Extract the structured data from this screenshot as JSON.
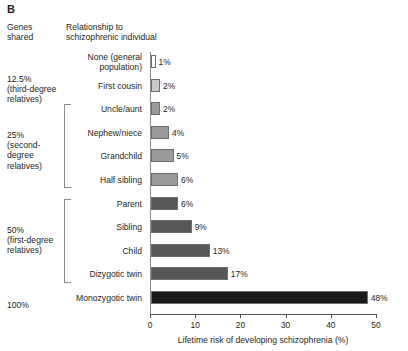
{
  "panel": {
    "letter": "B"
  },
  "headers": {
    "genes_shared": "Genes\nshared",
    "genes_shared_line1": "Genes",
    "genes_shared_line2": "shared",
    "relationship_line1": "Relationship to",
    "relationship_line2": "schizophrenic individual"
  },
  "groups": [
    {
      "id": "third-degree",
      "line1": "12.5%",
      "line2": "(third-degree",
      "line3": "relatives)",
      "bracket": false
    },
    {
      "id": "second-degree",
      "line1": "25%",
      "line2": "(second-degree",
      "line3": "relatives)",
      "bracket": true
    },
    {
      "id": "first-degree",
      "line1": "50%",
      "line2": "(first-degree",
      "line3": "relatives)",
      "bracket": true
    },
    {
      "id": "identical",
      "line1": "100%",
      "line2": "",
      "line3": "",
      "bracket": false
    }
  ],
  "chart_data": {
    "type": "bar",
    "orientation": "horizontal",
    "title": "",
    "xlabel": "Lifetime risk of developing schizophrenia (%)",
    "ylabel": "Relationship to schizophrenic individual",
    "xlim": [
      0,
      50
    ],
    "xticks": [
      0,
      10,
      20,
      30,
      40,
      50
    ],
    "xtick_labels": [
      "0",
      "10",
      "20",
      "30",
      "40",
      "50"
    ],
    "grid": false,
    "legend": "none",
    "categories": [
      "None (general population)",
      "First cousin",
      "Uncle/aunt",
      "Nephew/niece",
      "Grandchild",
      "Half sibling",
      "Parent",
      "Sibling",
      "Child",
      "Dizygotic twin",
      "Monozygotic twin"
    ],
    "values": [
      1,
      2,
      2,
      4,
      5,
      6,
      6,
      9,
      13,
      17,
      48
    ],
    "value_labels": [
      "1%",
      "2%",
      "2%",
      "4%",
      "5%",
      "6%",
      "6%",
      "9%",
      "13%",
      "17%",
      "48%"
    ],
    "bar_colors": [
      "#ffffff",
      "#c9c9c9",
      "#9a9a9a",
      "#9a9a9a",
      "#9a9a9a",
      "#9a9a9a",
      "#575757",
      "#575757",
      "#575757",
      "#575757",
      "#1a1a1a"
    ],
    "rows": [
      {
        "label_line1": "None (general",
        "label_line2": "population)",
        "value": 1,
        "value_label": "1%",
        "color": "#ffffff"
      },
      {
        "label_line1": "First cousin",
        "label_line2": "",
        "value": 2,
        "value_label": "2%",
        "color": "#c9c9c9"
      },
      {
        "label_line1": "Uncle/aunt",
        "label_line2": "",
        "value": 2,
        "value_label": "2%",
        "color": "#9a9a9a"
      },
      {
        "label_line1": "Nephew/niece",
        "label_line2": "",
        "value": 4,
        "value_label": "4%",
        "color": "#9a9a9a"
      },
      {
        "label_line1": "Grandchild",
        "label_line2": "",
        "value": 5,
        "value_label": "5%",
        "color": "#9a9a9a"
      },
      {
        "label_line1": "Half sibling",
        "label_line2": "",
        "value": 6,
        "value_label": "6%",
        "color": "#9a9a9a"
      },
      {
        "label_line1": "Parent",
        "label_line2": "",
        "value": 6,
        "value_label": "6%",
        "color": "#575757"
      },
      {
        "label_line1": "Sibling",
        "label_line2": "",
        "value": 9,
        "value_label": "9%",
        "color": "#575757"
      },
      {
        "label_line1": "Child",
        "label_line2": "",
        "value": 13,
        "value_label": "13%",
        "color": "#575757"
      },
      {
        "label_line1": "Dizygotic twin",
        "label_line2": "",
        "value": 17,
        "value_label": "17%",
        "color": "#575757"
      },
      {
        "label_line1": "Monozygotic twin",
        "label_line2": "",
        "value": 48,
        "value_label": "48%",
        "color": "#1a1a1a"
      }
    ]
  }
}
